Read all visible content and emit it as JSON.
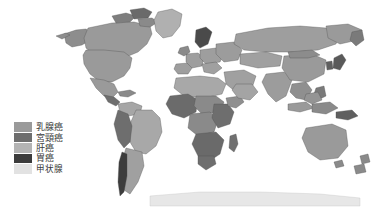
{
  "figure": {
    "type": "world-choropleth-map",
    "background_color": "#ffffff",
    "title": "",
    "projection": "equirectangular",
    "border_color": "#5a5a5a"
  },
  "legend": {
    "position": "lower-left",
    "items": [
      {
        "label": "乳腺癌",
        "color": "#9a9a9a",
        "meaning": "breast-cancer"
      },
      {
        "label": "宮頸癌",
        "color": "#6e6e6e",
        "meaning": "cervical-cancer"
      },
      {
        "label": "肝癌",
        "color": "#b4b4b4",
        "meaning": "liver-cancer"
      },
      {
        "label": "胃癌",
        "color": "#3c3c3c",
        "meaning": "stomach-cancer"
      },
      {
        "label": "甲状腺",
        "color": "#e2e2e2",
        "meaning": "thyroid-cancer"
      }
    ]
  },
  "map_regions": {
    "ocean_color": "#ffffff",
    "outline_color": "#4e4e4e",
    "regions": [
      {
        "name": "north-america",
        "fill": "#9a9a9a"
      },
      {
        "name": "greenland",
        "fill": "#b0b0b0"
      },
      {
        "name": "canada-arctic-islands",
        "fill": "#8d8d8d"
      },
      {
        "name": "central-america",
        "fill": "#9a9a9a"
      },
      {
        "name": "south-america",
        "fill": "#a6a6a6"
      },
      {
        "name": "andes-band",
        "fill": "#6e6e6e"
      },
      {
        "name": "southern-cone",
        "fill": "#3c3c3c"
      },
      {
        "name": "europe",
        "fill": "#9e9e9e"
      },
      {
        "name": "scandinavia",
        "fill": "#4a4a4a"
      },
      {
        "name": "north-africa",
        "fill": "#a8a8a8"
      },
      {
        "name": "west-africa",
        "fill": "#6b6b6b"
      },
      {
        "name": "central-africa",
        "fill": "#8a8a8a"
      },
      {
        "name": "east-africa",
        "fill": "#6e6e6e"
      },
      {
        "name": "southern-africa",
        "fill": "#6a6a6a"
      },
      {
        "name": "madagascar",
        "fill": "#707070"
      },
      {
        "name": "middle-east",
        "fill": "#a0a0a0"
      },
      {
        "name": "russia-central-asia",
        "fill": "#9e9e9e"
      },
      {
        "name": "south-asia",
        "fill": "#9c9c9c"
      },
      {
        "name": "china",
        "fill": "#9a9a9a"
      },
      {
        "name": "japan-korea",
        "fill": "#5a5a5a"
      },
      {
        "name": "southeast-asia",
        "fill": "#8f8f8f"
      },
      {
        "name": "indonesia",
        "fill": "#9a9a9a"
      },
      {
        "name": "australia",
        "fill": "#9a9a9a"
      },
      {
        "name": "new-zealand",
        "fill": "#8a8a8a"
      },
      {
        "name": "papua-new-guinea",
        "fill": "#5f5f5f"
      },
      {
        "name": "antarctica-fringe",
        "fill": "#bdbdbd"
      }
    ]
  }
}
